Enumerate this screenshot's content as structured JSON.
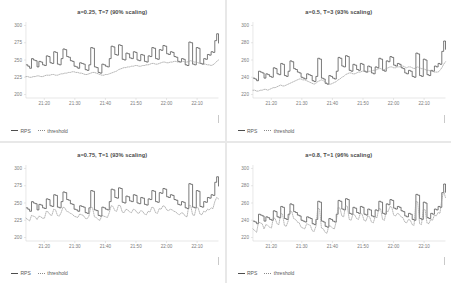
{
  "figure": {
    "background": "#f4f4f4",
    "panel_background": "#ffffff",
    "rps_color": "#4d4d4d",
    "threshold_color": "#9a9a9a"
  },
  "legend": {
    "rps_label": "RPS",
    "threshold_label": "threshold"
  },
  "chart_data": [
    {
      "type": "line",
      "title": "a=0.25, T=7 (90% scaling)",
      "xlabel": "",
      "ylabel": "",
      "grid": false,
      "legend_position": "bottom-left",
      "xticklabels": [
        "21:20",
        "21:30",
        "21:40",
        "21:50",
        "22:00",
        "22:10"
      ],
      "yticklabels": [
        "200",
        "225",
        "250",
        "275",
        "300"
      ],
      "ylim": [
        195,
        305
      ],
      "yticks": [
        200,
        225,
        250,
        275,
        300
      ],
      "series": [
        {
          "name": "RPS",
          "style": "solid-step",
          "values": [
            243,
            241,
            238,
            252,
            250,
            249,
            240,
            248,
            247,
            243,
            242,
            256,
            255,
            246,
            245,
            262,
            261,
            244,
            243,
            252,
            266,
            265,
            255,
            254,
            249,
            248,
            241,
            240,
            238,
            246,
            245,
            244,
            236,
            235,
            243,
            268,
            267,
            240,
            239,
            232,
            231,
            244,
            243,
            241,
            240,
            252,
            270,
            269,
            258,
            257,
            272,
            271,
            251,
            250,
            260,
            259,
            253,
            252,
            262,
            261,
            250,
            249,
            258,
            257,
            248,
            247,
            256,
            255,
            268,
            267,
            252,
            251,
            265,
            264,
            271,
            270,
            259,
            258,
            262,
            261,
            255,
            254,
            248,
            247,
            252,
            251,
            243,
            242,
            276,
            275,
            244,
            243,
            268,
            267,
            245,
            244,
            252,
            251,
            258,
            257,
            262,
            261,
            278,
            288,
            274
          ]
        },
        {
          "name": "threshold",
          "style": "dotted",
          "values": [
            226,
            226,
            225,
            225,
            226,
            226,
            227,
            227,
            226,
            226,
            227,
            228,
            228,
            228,
            229,
            229,
            228,
            228,
            229,
            230,
            230,
            231,
            231,
            232,
            232,
            233,
            233,
            232,
            232,
            231,
            231,
            230,
            229,
            229,
            230,
            231,
            232,
            232,
            231,
            230,
            229,
            228,
            228,
            229,
            229,
            230,
            231,
            232,
            233,
            234,
            236,
            237,
            238,
            239,
            239,
            240,
            240,
            241,
            241,
            242,
            242,
            241,
            241,
            242,
            242,
            243,
            243,
            244,
            245,
            245,
            244,
            244,
            245,
            246,
            247,
            247,
            246,
            246,
            247,
            247,
            248,
            248,
            247,
            247,
            248,
            248,
            247,
            247,
            248,
            249,
            248,
            247,
            247,
            246,
            245,
            245,
            244,
            244,
            243,
            243,
            242,
            243,
            245,
            248,
            250
          ]
        }
      ]
    },
    {
      "type": "line",
      "title": "a=0.5, T=3 (93% scaling)",
      "xlabel": "",
      "ylabel": "",
      "grid": false,
      "legend_position": "bottom-left",
      "xticklabels": [
        "21:20",
        "21:30",
        "21:40",
        "21:50",
        "22:00",
        "22:10"
      ],
      "yticklabels": [
        "220",
        "240",
        "260",
        "280",
        "300"
      ],
      "ylim": [
        216,
        304
      ],
      "yticks": [
        220,
        240,
        260,
        280,
        300
      ],
      "series": [
        {
          "name": "RPS",
          "style": "solid-step",
          "values": [
            239,
            238,
            236,
            247,
            246,
            245,
            239,
            244,
            243,
            241,
            240,
            251,
            250,
            244,
            243,
            256,
            255,
            242,
            241,
            247,
            259,
            258,
            250,
            249,
            246,
            245,
            240,
            239,
            238,
            244,
            243,
            242,
            236,
            235,
            241,
            262,
            261,
            239,
            238,
            233,
            232,
            242,
            241,
            239,
            238,
            247,
            263,
            262,
            253,
            252,
            265,
            264,
            248,
            247,
            255,
            254,
            249,
            248,
            256,
            255,
            247,
            246,
            253,
            252,
            245,
            244,
            252,
            251,
            262,
            261,
            248,
            247,
            259,
            258,
            264,
            263,
            254,
            253,
            256,
            255,
            251,
            250,
            245,
            244,
            248,
            247,
            241,
            240,
            268,
            267,
            242,
            241,
            261,
            260,
            243,
            242,
            248,
            247,
            253,
            252,
            256,
            255,
            270,
            282,
            272
          ]
        },
        {
          "name": "threshold",
          "style": "dotted",
          "values": [
            225,
            225,
            224,
            224,
            225,
            225,
            226,
            226,
            225,
            226,
            227,
            228,
            228,
            229,
            230,
            231,
            230,
            230,
            231,
            232,
            233,
            234,
            235,
            236,
            237,
            238,
            238,
            237,
            237,
            236,
            235,
            234,
            233,
            232,
            233,
            235,
            236,
            237,
            236,
            235,
            233,
            232,
            232,
            233,
            234,
            235,
            237,
            238,
            240,
            241,
            243,
            244,
            245,
            245,
            244,
            244,
            245,
            246,
            246,
            247,
            247,
            246,
            246,
            247,
            247,
            248,
            248,
            249,
            250,
            250,
            249,
            249,
            250,
            251,
            252,
            252,
            251,
            251,
            252,
            252,
            253,
            253,
            252,
            251,
            252,
            252,
            251,
            250,
            251,
            252,
            251,
            250,
            250,
            249,
            248,
            248,
            247,
            247,
            246,
            246,
            246,
            248,
            251,
            255,
            258
          ]
        }
      ]
    },
    {
      "type": "line",
      "title": "a=0.75, T=1 (93% scaling)",
      "xlabel": "",
      "ylabel": "",
      "grid": false,
      "legend_position": "bottom-left",
      "xticklabels": [
        "21:20",
        "21:30",
        "21:40",
        "21:50",
        "22:00",
        "22:10"
      ],
      "yticklabels": [
        "200",
        "225",
        "250",
        "275",
        "300"
      ],
      "ylim": [
        195,
        305
      ],
      "yticks": [
        200,
        225,
        250,
        275,
        300
      ],
      "series": [
        {
          "name": "RPS",
          "style": "solid-step",
          "values": [
            243,
            241,
            238,
            252,
            250,
            249,
            240,
            248,
            247,
            243,
            242,
            256,
            255,
            246,
            245,
            262,
            261,
            244,
            243,
            252,
            266,
            265,
            255,
            254,
            249,
            248,
            241,
            240,
            238,
            246,
            245,
            244,
            236,
            235,
            243,
            268,
            267,
            240,
            239,
            232,
            231,
            244,
            243,
            241,
            240,
            252,
            270,
            269,
            258,
            257,
            272,
            271,
            251,
            250,
            260,
            259,
            253,
            252,
            262,
            261,
            250,
            249,
            258,
            257,
            248,
            247,
            256,
            255,
            268,
            267,
            252,
            251,
            265,
            264,
            271,
            270,
            259,
            258,
            262,
            261,
            255,
            254,
            248,
            247,
            252,
            251,
            243,
            242,
            278,
            277,
            244,
            243,
            268,
            267,
            245,
            244,
            252,
            251,
            258,
            257,
            262,
            261,
            280,
            288,
            274
          ]
        },
        {
          "name": "threshold",
          "style": "dotted",
          "values": [
            228,
            226,
            224,
            232,
            231,
            230,
            226,
            231,
            230,
            228,
            228,
            238,
            237,
            233,
            232,
            241,
            240,
            232,
            231,
            236,
            244,
            243,
            238,
            237,
            235,
            234,
            231,
            230,
            229,
            234,
            233,
            232,
            228,
            227,
            231,
            244,
            243,
            230,
            229,
            226,
            225,
            232,
            231,
            230,
            229,
            236,
            246,
            245,
            239,
            238,
            247,
            246,
            237,
            236,
            241,
            240,
            237,
            236,
            241,
            240,
            236,
            235,
            239,
            238,
            234,
            233,
            238,
            237,
            244,
            243,
            236,
            235,
            242,
            241,
            246,
            245,
            240,
            239,
            241,
            240,
            238,
            237,
            234,
            233,
            236,
            235,
            231,
            230,
            247,
            246,
            233,
            232,
            244,
            243,
            234,
            233,
            238,
            237,
            241,
            240,
            243,
            242,
            252,
            258,
            256
          ]
        }
      ]
    },
    {
      "type": "line",
      "title": "a=0.8, T=1 (96% scaling)",
      "xlabel": "",
      "ylabel": "",
      "grid": false,
      "legend_position": "bottom-left",
      "xticklabels": [
        "21:20",
        "21:30",
        "21:40",
        "21:50",
        "22:00",
        "22:10"
      ],
      "yticklabels": [
        "220",
        "240",
        "260",
        "280",
        "300"
      ],
      "ylim": [
        216,
        304
      ],
      "yticks": [
        220,
        240,
        260,
        280,
        300
      ],
      "series": [
        {
          "name": "RPS",
          "style": "solid-step",
          "values": [
            239,
            238,
            236,
            247,
            246,
            245,
            239,
            244,
            243,
            241,
            240,
            251,
            250,
            244,
            243,
            256,
            255,
            242,
            241,
            247,
            259,
            258,
            250,
            249,
            246,
            245,
            240,
            239,
            238,
            244,
            243,
            242,
            236,
            235,
            241,
            262,
            261,
            239,
            238,
            233,
            232,
            242,
            241,
            239,
            238,
            247,
            263,
            262,
            253,
            252,
            265,
            264,
            248,
            247,
            255,
            254,
            249,
            248,
            256,
            255,
            247,
            246,
            253,
            252,
            245,
            244,
            252,
            251,
            262,
            261,
            248,
            247,
            259,
            258,
            264,
            263,
            254,
            253,
            256,
            255,
            251,
            250,
            245,
            244,
            248,
            247,
            241,
            240,
            270,
            269,
            242,
            241,
            261,
            260,
            243,
            242,
            248,
            247,
            253,
            252,
            256,
            255,
            272,
            282,
            272
          ]
        },
        {
          "name": "threshold",
          "style": "dotted",
          "values": [
            230,
            228,
            226,
            238,
            237,
            236,
            230,
            235,
            234,
            232,
            231,
            243,
            242,
            236,
            235,
            248,
            247,
            234,
            233,
            239,
            251,
            250,
            242,
            241,
            238,
            237,
            232,
            231,
            230,
            236,
            235,
            234,
            228,
            227,
            233,
            254,
            253,
            231,
            230,
            226,
            225,
            234,
            233,
            231,
            230,
            239,
            255,
            254,
            245,
            244,
            257,
            256,
            241,
            240,
            247,
            246,
            242,
            241,
            248,
            247,
            240,
            239,
            245,
            244,
            238,
            237,
            244,
            243,
            254,
            253,
            241,
            240,
            251,
            250,
            256,
            255,
            246,
            245,
            248,
            247,
            244,
            243,
            238,
            237,
            241,
            240,
            235,
            234,
            262,
            261,
            236,
            235,
            253,
            252,
            237,
            236,
            241,
            240,
            246,
            245,
            249,
            248,
            264,
            274,
            266
          ]
        }
      ]
    }
  ]
}
